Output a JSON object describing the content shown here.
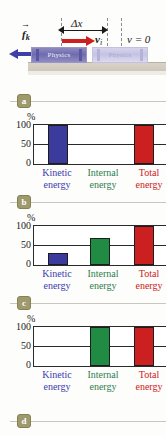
{
  "figure": {
    "diagram": {
      "displacement_label": "Δx",
      "velocity_label_vec": "v",
      "velocity_label_sub": "i",
      "final_velocity_label": "v = 0",
      "friction_label_vec": "f",
      "friction_label_sub": "k",
      "book_title": "Physics",
      "book_ghost_title": "Physics"
    },
    "panels": [
      {
        "id": "a",
        "label": "a"
      },
      {
        "id": "b",
        "label": "b"
      },
      {
        "id": "c",
        "label": "c"
      },
      {
        "id": "d",
        "label": "d"
      }
    ],
    "colors": {
      "kinetic": "#3b3b9e",
      "internal": "#1f8b43",
      "total": "#cc2020",
      "friction_arrow": "#3f3fa8",
      "velocity_arrow": "#cc1f1f",
      "panel_chip": "#9e9a6e"
    }
  },
  "chart_common": {
    "ylabel": "%",
    "yticks": [
      "100",
      "50",
      "0"
    ],
    "categories_line1": [
      "Kinetic",
      "Internal",
      "Total"
    ],
    "categories_line2": [
      "energy",
      "energy",
      "energy"
    ]
  },
  "chart_data": [
    {
      "type": "bar",
      "panel": "a",
      "title": "",
      "xlabel": "",
      "ylabel": "%",
      "ylim": [
        0,
        100
      ],
      "yticks": [
        0,
        50,
        100
      ],
      "grid": true,
      "legend": "none",
      "categories": [
        "Kinetic energy",
        "Internal energy",
        "Total energy"
      ],
      "values": [
        100,
        0,
        100
      ],
      "colors": [
        "#3b3b9e",
        "#1f8b43",
        "#cc2020"
      ]
    },
    {
      "type": "bar",
      "panel": "b",
      "title": "",
      "xlabel": "",
      "ylabel": "%",
      "ylim": [
        0,
        100
      ],
      "yticks": [
        0,
        50,
        100
      ],
      "grid": true,
      "legend": "none",
      "categories": [
        "Kinetic energy",
        "Internal energy",
        "Total energy"
      ],
      "values": [
        30,
        70,
        100
      ],
      "colors": [
        "#3b3b9e",
        "#1f8b43",
        "#cc2020"
      ]
    },
    {
      "type": "bar",
      "panel": "c",
      "title": "",
      "xlabel": "",
      "ylabel": "%",
      "ylim": [
        0,
        100
      ],
      "yticks": [
        0,
        50,
        100
      ],
      "grid": true,
      "legend": "none",
      "categories": [
        "Kinetic energy",
        "Internal energy",
        "Total energy"
      ],
      "values": [
        0,
        100,
        100
      ],
      "colors": [
        "#3b3b9e",
        "#1f8b43",
        "#cc2020"
      ]
    }
  ]
}
